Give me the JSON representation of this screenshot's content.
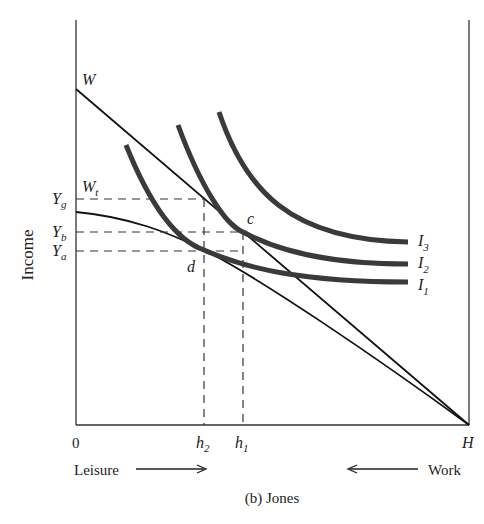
{
  "diagram": {
    "caption": "(b) Jones",
    "y_axis_label": "Income",
    "origin_label": "0",
    "x_end_label": "H",
    "leisure_label": "Leisure",
    "work_label": "Work",
    "budget_line_label": "W",
    "tax_budget_label": "W",
    "tax_budget_sub": "t",
    "y_ticks": [
      {
        "main": "Y",
        "sub": "g"
      },
      {
        "main": "Y",
        "sub": "b"
      },
      {
        "main": "Y",
        "sub": "a"
      }
    ],
    "x_ticks": [
      {
        "main": "h",
        "sub": "2"
      },
      {
        "main": "h",
        "sub": "1"
      }
    ],
    "point_c": "c",
    "point_d": "d",
    "indifference_curves": [
      {
        "main": "I",
        "sub": "3"
      },
      {
        "main": "I",
        "sub": "2"
      },
      {
        "main": "I",
        "sub": "1"
      }
    ],
    "colors": {
      "axis": "#333333",
      "line": "#111111",
      "curve": "#3a3a3a"
    }
  }
}
